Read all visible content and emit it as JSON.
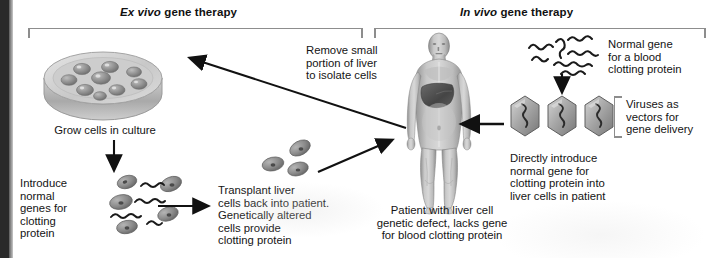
{
  "figure": {
    "title_left_italic": "Ex vivo",
    "title_left_rest": " gene therapy",
    "title_right_italic": "In vivo",
    "title_right_rest": " gene therapy"
  },
  "labels": {
    "grow_cells": "Grow cells in culture",
    "introduce_genes": "Introduce\nnormal\ngenes for\nclotting\nprotein",
    "transplant": "Transplant liver\ncells back into patient.\nGenetically altered\ncells provide\nclotting protein",
    "remove_portion": "Remove small\nportion of liver\nto isolate cells",
    "patient": "Patient with liver cell\ngenetic defect, lacks gene\nfor blood clotting protein",
    "normal_gene": "Normal gene\nfor a blood\nclotting protein",
    "viruses_vectors": "Viruses as\nvectors for\ngene delivery",
    "directly_introduce": "Directly introduce\nnormal gene for\nclotting protein into\nliver cells in patient"
  },
  "graphics": {
    "petri_dish": "petri-dish-with-cells",
    "cell_count_dish": 9,
    "cell_cluster_left": "liver-cells-with-dna-strands",
    "cell_cluster_mid": "altered-liver-cells",
    "dna_strands_top": 6,
    "virus_capsids": 3,
    "human_figure": "human-body-with-liver-highlighted"
  },
  "colors": {
    "bracket": "#8d8d8d",
    "arrow": "#111111",
    "text": "#141414",
    "cell_fill": "#9a9a9a",
    "liver": "#4f4f4f",
    "skin": "#b9b9b9",
    "sidebar": "#2a2a2a"
  }
}
